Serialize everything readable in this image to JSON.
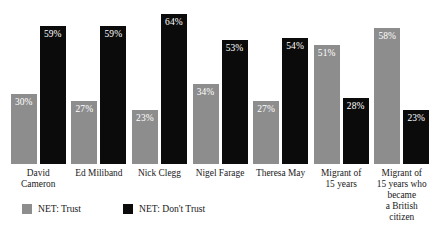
{
  "chart_data": {
    "type": "bar",
    "title": "",
    "subtitle": "",
    "xlabel": "",
    "ylabel": "",
    "ylim": [
      0,
      70
    ],
    "grid": false,
    "legend_position": "bottom-left",
    "categories": [
      "David Cameron",
      "Ed Miliband",
      "Nick Clegg",
      "Nigel Farage",
      "Theresa May",
      "Migrant of\n15 years",
      "Migrant of\n15 years who became\na British citizen"
    ],
    "category_lines": [
      [
        "David Cameron"
      ],
      [
        "Ed Miliband"
      ],
      [
        "Nick Clegg"
      ],
      [
        "Nigel Farage"
      ],
      [
        "Theresa May"
      ],
      [
        "Migrant of",
        "15 years"
      ],
      [
        "Migrant of",
        "15 years who became",
        "a British citizen"
      ]
    ],
    "series": [
      {
        "name": "NET: Trust",
        "color": "#8d8d8d",
        "values": [
          30,
          27,
          23,
          34,
          27,
          51,
          58
        ],
        "labels": [
          "30%",
          "27%",
          "23%",
          "34%",
          "27%",
          "51%",
          "58%"
        ]
      },
      {
        "name": "NET: Don't Trust",
        "color": "#0b0b0b",
        "values": [
          59,
          59,
          64,
          53,
          54,
          28,
          23
        ],
        "labels": [
          "59%",
          "59%",
          "64%",
          "53%",
          "54%",
          "28%",
          "23%"
        ]
      }
    ]
  },
  "legend": {
    "items": [
      {
        "label": "NET: Trust",
        "color": "#8d8d8d"
      },
      {
        "label": "NET: Don't Trust",
        "color": "#0b0b0b"
      }
    ]
  }
}
